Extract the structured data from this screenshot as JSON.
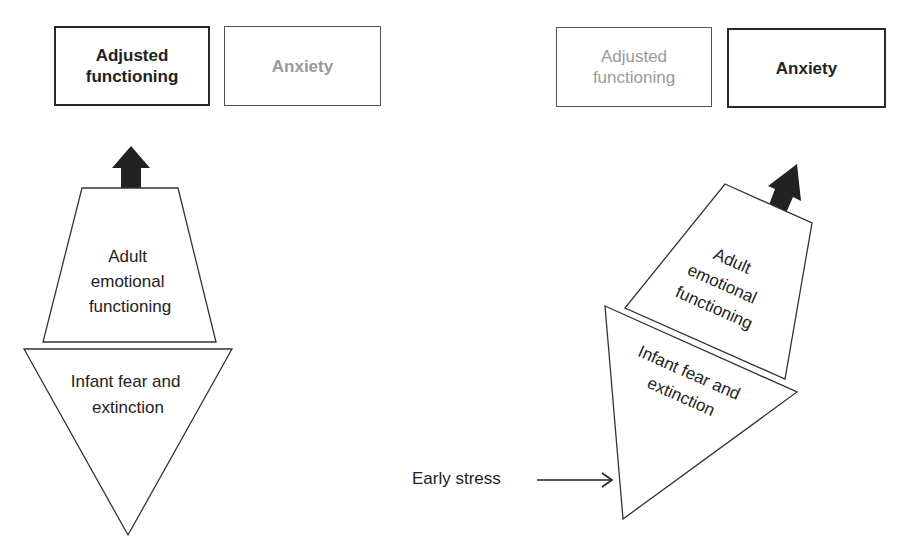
{
  "left_panel": {
    "outcome_boxes": [
      {
        "label": "Adjusted functioning",
        "line1": "Adjusted",
        "line2": "functioning",
        "state": "active"
      },
      {
        "label": "Anxiety",
        "state": "inactive"
      }
    ],
    "upper_shape": {
      "line1": "Adult",
      "line2": "emotional",
      "line3": "functioning"
    },
    "lower_shape": {
      "line1": "Infant fear and",
      "line2": "extinction"
    }
  },
  "right_panel": {
    "outcome_boxes": [
      {
        "label": "Adjusted functioning",
        "line1": "Adjusted",
        "line2": "functioning",
        "state": "inactive"
      },
      {
        "label": "Anxiety",
        "state": "active"
      }
    ],
    "upper_shape": {
      "line1": "Adult",
      "line2": "emotional",
      "line3": "functioning"
    },
    "lower_shape": {
      "line1": "Infant fear and",
      "line2": "extinction"
    },
    "input_label": "Early stress"
  },
  "colors": {
    "active_text": "#222222",
    "inactive_text": "#9a9a9a",
    "arrow": "#222222"
  }
}
